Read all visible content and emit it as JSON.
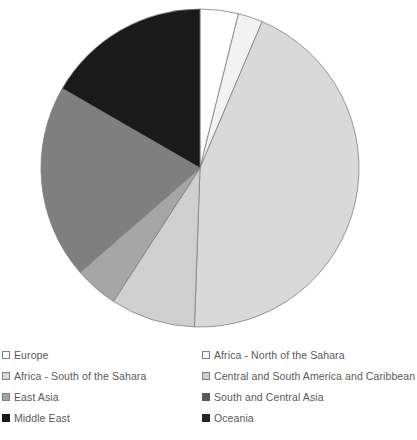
{
  "chart_data": {
    "type": "pie",
    "title": "",
    "subtitle": "",
    "xlabel": "",
    "ylabel": "",
    "grid": false,
    "legend_position": "bottom",
    "legend_columns": 2,
    "start_angle_deg": 0,
    "direction": "clockwise",
    "categories": [
      "Europe",
      "Africa - North of the Sahara",
      "Africa - South of the Sahara",
      "Central and South America and Caribbean",
      "East Asia",
      "South and Central Asia",
      "Middle East",
      "Oceania"
    ],
    "values": [
      3.9,
      2.5,
      19.7,
      44.2,
      4.4,
      8.6,
      16.7,
      0.0
    ],
    "slices": [
      {
        "label": "Europe",
        "value": 3.9,
        "start_deg": 0.0,
        "end_deg": 14.0,
        "color": "#ffffff",
        "stroke": "#7f7f7f"
      },
      {
        "label": "Africa - North of the Sahara",
        "value": 2.5,
        "start_deg": 14.0,
        "end_deg": 23.0,
        "color": "#f2f2f2",
        "stroke": "#7f7f7f"
      },
      {
        "label": "Central and South America and Caribbean",
        "value": 44.2,
        "start_deg": 23.0,
        "end_deg": 182.0,
        "color": "#d9d9d9",
        "stroke": "#7f7f7f"
      },
      {
        "label": "South and Central Asia",
        "value": 8.6,
        "start_deg": 182.0,
        "end_deg": 213.0,
        "color": "#cfcfcf",
        "stroke": "#7f7f7f"
      },
      {
        "label": "East Asia",
        "value": 4.4,
        "start_deg": 213.0,
        "end_deg": 229.0,
        "color": "#a6a6a6",
        "stroke": "#7f7f7f"
      },
      {
        "label": "Africa - South of the Sahara",
        "value": 19.7,
        "start_deg": 229.0,
        "end_deg": 300.0,
        "color": "#7f7f7f",
        "stroke": "#7f7f7f"
      },
      {
        "label": "Middle East",
        "value": 16.7,
        "start_deg": 300.0,
        "end_deg": 360.0,
        "color": "#1a1a1a",
        "stroke": "#7f7f7f"
      }
    ],
    "geometry": {
      "center_x": 200,
      "center_y": 168,
      "radius": 159
    }
  },
  "legend": {
    "items": [
      {
        "label": "Europe",
        "color": "#ffffff",
        "border": "#7f7f7f"
      },
      {
        "label": "Africa - North of the Sahara",
        "color": "#f7f7f7",
        "border": "#7f7f7f"
      },
      {
        "label": "Africa - South of the Sahara",
        "color": "#dcdcdc",
        "border": "#7f7f7f"
      },
      {
        "label": "Central and South America and Caribbean",
        "color": "#d0d0d0",
        "border": "#7f7f7f"
      },
      {
        "label": "East Asia",
        "color": "#a6a6a6",
        "border": "#7f7f7f"
      },
      {
        "label": "South and Central Asia",
        "color": "#595959",
        "border": "#595959"
      },
      {
        "label": "Middle East",
        "color": "#1a1a1a",
        "border": "#1a1a1a"
      },
      {
        "label": "Oceania",
        "color": "#262626",
        "border": "#262626"
      }
    ]
  }
}
